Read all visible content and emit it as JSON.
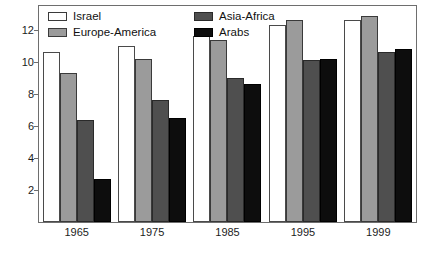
{
  "chart_data": {
    "type": "bar",
    "title": "",
    "subtitle": "",
    "xlabel": "",
    "ylabel": "",
    "categories": [
      "1965",
      "1975",
      "1985",
      "1995",
      "1999"
    ],
    "series": [
      {
        "name": "Israel",
        "color": "#ffffff",
        "values": [
          10.6,
          11.0,
          11.6,
          12.3,
          12.6
        ]
      },
      {
        "name": "Europe-America",
        "color": "#9b9b9b",
        "values": [
          9.3,
          10.2,
          11.4,
          12.6,
          12.9
        ]
      },
      {
        "name": "Asia-Africa",
        "color": "#4f4f4f",
        "values": [
          6.4,
          7.6,
          9.0,
          10.1,
          10.6
        ]
      },
      {
        "name": "Arabs",
        "color": "#0d0d0d",
        "values": [
          2.7,
          6.5,
          8.6,
          10.2,
          10.8
        ]
      }
    ],
    "ylim": [
      0,
      13.5
    ],
    "yticks": [
      2,
      4,
      6,
      8,
      10,
      12
    ],
    "ytick_labels": [
      "2",
      "4",
      "6",
      "8",
      "10",
      "12"
    ],
    "grid": false,
    "legend_position": "top-left-inside",
    "frame": true
  },
  "legend": {
    "items": [
      {
        "label": "Israel",
        "swatch": "israel"
      },
      {
        "label": "Asia-Africa",
        "swatch": "asia"
      },
      {
        "label": "Europe-America",
        "swatch": "europe"
      },
      {
        "label": "Arabs",
        "swatch": "arabs"
      }
    ]
  }
}
